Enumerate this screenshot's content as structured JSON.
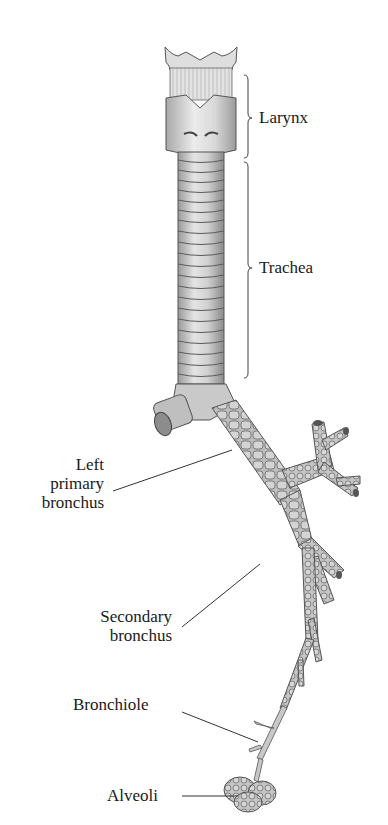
{
  "diagram": {
    "title": "",
    "labels": {
      "larynx": "Larynx",
      "trachea": "Trachea",
      "left_primary_bronchus": [
        "Left",
        "primary",
        "bronchus"
      ],
      "secondary_bronchus": [
        "Secondary",
        "bronchus"
      ],
      "bronchiole": "Bronchiole",
      "alveoli": "Alveoli"
    },
    "colors": {
      "tissue_light": "#d8d8d8",
      "tissue_mid": "#b5b5b5",
      "tissue_dark": "#7a7a7a",
      "outline": "#4a4a4a",
      "leader_line": "#333333",
      "text": "#1a1a1a"
    }
  }
}
